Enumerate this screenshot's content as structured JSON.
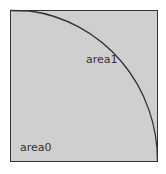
{
  "diagram": {
    "regions": [
      {
        "id": "area0",
        "label": "area0"
      },
      {
        "id": "area1",
        "label": "area1"
      }
    ],
    "colors": {
      "fill": "#cfcfcf",
      "stroke": "#333333",
      "background": "#ffffff"
    }
  }
}
